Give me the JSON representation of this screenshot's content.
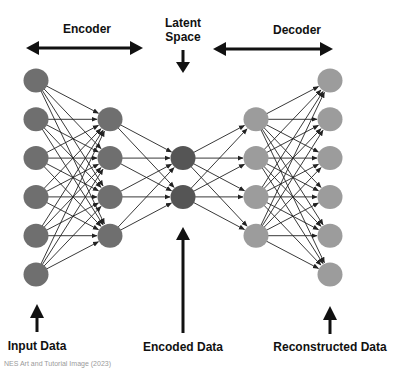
{
  "labels": {
    "encoder": "Encoder",
    "latent_line1": "Latent",
    "latent_line2": "Space",
    "decoder": "Decoder",
    "input": "Input Data",
    "encoded": "Encoded Data",
    "reconstructed": "Reconstructed Data"
  },
  "caption": "NES Art and Tutorial Image (2023)",
  "colors": {
    "encoder_node": "#6f6f6f",
    "latent_node": "#555555",
    "decoder_node": "#9c9c9c",
    "edge": "#222222",
    "text": "#111111"
  },
  "layers": [
    {
      "name": "input",
      "nodes": 6,
      "role": "encoder"
    },
    {
      "name": "hidden-encoder",
      "nodes": 4,
      "role": "encoder"
    },
    {
      "name": "latent",
      "nodes": 2,
      "role": "latent"
    },
    {
      "name": "hidden-decoder",
      "nodes": 4,
      "role": "decoder"
    },
    {
      "name": "output",
      "nodes": 6,
      "role": "decoder"
    }
  ]
}
